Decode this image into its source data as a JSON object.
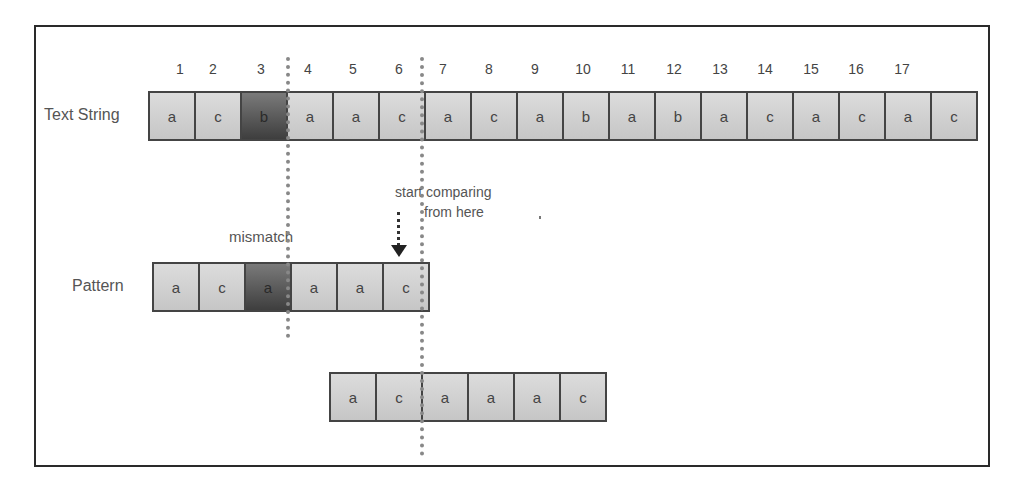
{
  "labels": {
    "text_string": "Text String",
    "pattern": "Pattern",
    "mismatch": "mismatch",
    "start_comparing_line1": "start comparing",
    "start_comparing_line2": "from here"
  },
  "index_numbers": [
    "1",
    "2",
    "3",
    "4",
    "5",
    "6",
    "7",
    "8",
    "9",
    "10",
    "11",
    "12",
    "13",
    "14",
    "15",
    "16",
    "17"
  ],
  "text_string": {
    "cells": [
      "a",
      "c",
      "b",
      "a",
      "a",
      "c",
      "a",
      "c",
      "a",
      "b",
      "a",
      "b",
      "a",
      "c",
      "a",
      "c",
      "a",
      "c"
    ],
    "mismatch_index": 2
  },
  "pattern": {
    "cells": [
      "a",
      "c",
      "a",
      "a",
      "a",
      "c"
    ],
    "mismatch_index": 2
  },
  "shifted_pattern": {
    "cells": [
      "a",
      "c",
      "a",
      "a",
      "a",
      "c"
    ]
  },
  "colors": {
    "cell_light": "#d0d0d0",
    "cell_dark": "#555555",
    "border": "#444444",
    "dotted_line": "#888888"
  }
}
